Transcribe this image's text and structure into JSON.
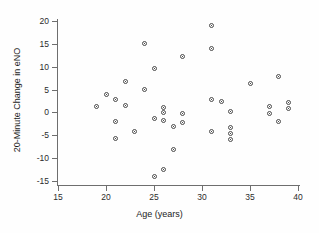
{
  "chart_data": {
    "type": "scatter",
    "title": "",
    "xlabel": "Age (years)",
    "ylabel": "20-Minute Change in eNO",
    "xlim": [
      15,
      40
    ],
    "ylim": [
      -15,
      20
    ],
    "xticks": [
      15,
      20,
      25,
      30,
      35,
      40
    ],
    "yticks": [
      -15,
      -10,
      -5,
      0,
      5,
      10,
      15,
      20
    ],
    "grid": false,
    "legend": null,
    "marker": "open-circle",
    "marker_color": "#4a4a4a",
    "points": [
      {
        "x": 19.0,
        "y": 1.2
      },
      {
        "x": 20.0,
        "y": 4.0
      },
      {
        "x": 21.0,
        "y": 2.8
      },
      {
        "x": 21.0,
        "y": -2.0
      },
      {
        "x": 21.0,
        "y": -5.7
      },
      {
        "x": 22.0,
        "y": 6.8
      },
      {
        "x": 22.0,
        "y": 1.5
      },
      {
        "x": 23.0,
        "y": -4.1
      },
      {
        "x": 24.0,
        "y": 15.1
      },
      {
        "x": 24.0,
        "y": 5.0
      },
      {
        "x": 25.0,
        "y": 9.6
      },
      {
        "x": 25.0,
        "y": -1.3
      },
      {
        "x": 25.0,
        "y": -14.1
      },
      {
        "x": 26.0,
        "y": 1.1
      },
      {
        "x": 26.0,
        "y": 0.0
      },
      {
        "x": 26.0,
        "y": -1.7
      },
      {
        "x": 26.0,
        "y": -12.4
      },
      {
        "x": 27.0,
        "y": -3.0
      },
      {
        "x": 27.0,
        "y": -8.0
      },
      {
        "x": 28.0,
        "y": 12.2
      },
      {
        "x": 28.0,
        "y": -0.2
      },
      {
        "x": 28.0,
        "y": -2.1
      },
      {
        "x": 31.0,
        "y": 19.1
      },
      {
        "x": 31.0,
        "y": 14.0
      },
      {
        "x": 31.0,
        "y": 2.8
      },
      {
        "x": 31.0,
        "y": -4.1
      },
      {
        "x": 32.0,
        "y": 2.5
      },
      {
        "x": 33.0,
        "y": 0.2
      },
      {
        "x": 33.0,
        "y": -3.4
      },
      {
        "x": 33.0,
        "y": -4.6
      },
      {
        "x": 33.0,
        "y": -6.0
      },
      {
        "x": 35.0,
        "y": 6.4
      },
      {
        "x": 37.0,
        "y": 1.4
      },
      {
        "x": 37.0,
        "y": -0.2
      },
      {
        "x": 38.0,
        "y": 7.9
      },
      {
        "x": 38.0,
        "y": -2.0
      },
      {
        "x": 39.0,
        "y": 2.2
      },
      {
        "x": 39.0,
        "y": 0.9
      }
    ]
  }
}
